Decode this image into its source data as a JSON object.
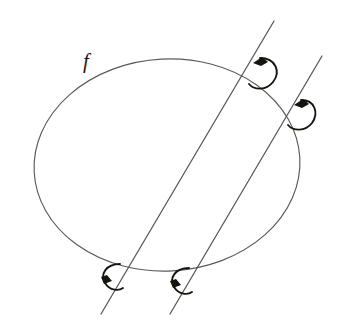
{
  "figure": {
    "title": "",
    "background_color": "#ffffff",
    "labels": [
      {
        "id": "curve-label-f",
        "text": "f",
        "x": 86,
        "y": 68,
        "style": "italic-serif"
      }
    ],
    "colors": {
      "curve": "#5a5a55",
      "line": "#55555a",
      "arrow": "#15150f",
      "label": "#1a1a16",
      "background": "#ffffff"
    },
    "ellipse": {
      "name": "closed-curve-f",
      "center_x": 167,
      "center_y": 165,
      "radius_x": 133,
      "radius_y": 106,
      "rotation_deg": -3,
      "stroke_width": 1.15
    },
    "lines": [
      {
        "name": "secant-line-left",
        "x1": 274,
        "y1": 21,
        "x2": 101,
        "y2": 314,
        "stroke_width": 1.25
      },
      {
        "name": "secant-line-right",
        "x1": 322,
        "y1": 56,
        "x2": 170,
        "y2": 314,
        "stroke_width": 1.25
      }
    ],
    "arrows": [
      {
        "name": "orientation-arrow-top-left-line",
        "at_x": 257,
        "at_y": 68,
        "direction": "counterclockwise",
        "head_direction": "up-left"
      },
      {
        "name": "orientation-arrow-top-right-line",
        "at_x": 298,
        "at_y": 110,
        "direction": "counterclockwise",
        "head_direction": "up-left"
      },
      {
        "name": "orientation-arrow-bottom-left-line",
        "at_x": 112,
        "at_y": 273,
        "direction": "clockwise",
        "head_direction": "down-left"
      },
      {
        "name": "orientation-arrow-bottom-right-line",
        "at_x": 180,
        "at_y": 277,
        "direction": "clockwise",
        "head_direction": "down-left"
      }
    ]
  }
}
